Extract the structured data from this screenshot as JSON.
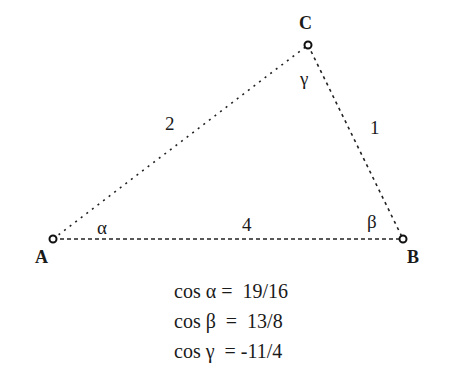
{
  "diagram": {
    "type": "triangle",
    "stroke_color": "#222222",
    "vertices": [
      {
        "id": "A",
        "label": "A",
        "x": 53,
        "y": 239
      },
      {
        "id": "B",
        "label": "B",
        "x": 403,
        "y": 239
      },
      {
        "id": "C",
        "label": "C",
        "x": 308,
        "y": 45
      }
    ],
    "sides": [
      {
        "from": "A",
        "to": "C",
        "label": "2"
      },
      {
        "from": "C",
        "to": "B",
        "label": "1"
      },
      {
        "from": "A",
        "to": "B",
        "label": "4"
      }
    ],
    "angles": [
      {
        "vertex": "A",
        "symbol": "α"
      },
      {
        "vertex": "B",
        "symbol": "β"
      },
      {
        "vertex": "C",
        "symbol": "γ"
      }
    ]
  },
  "equations": [
    {
      "text": "cos α =  19/16"
    },
    {
      "text": "cos β  =  13/8"
    },
    {
      "text": "cos γ  = -11/4"
    }
  ]
}
